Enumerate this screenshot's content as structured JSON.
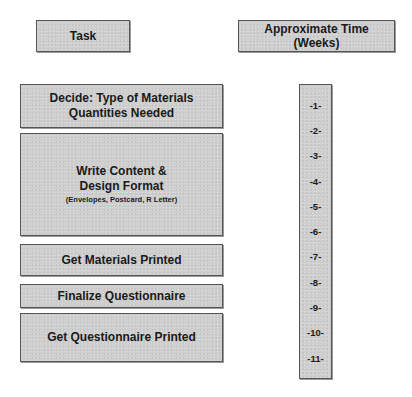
{
  "headers": {
    "task": "Task",
    "time_line1": "Approximate Time",
    "time_line2": "(Weeks)"
  },
  "tasks": [
    {
      "line1": "Decide: Type of Materials",
      "line2": "Quantities Needed",
      "sub": ""
    },
    {
      "line1": "Write Content &",
      "line2": "Design Format",
      "sub": "(Envelopes, Postcard, R Letter)"
    },
    {
      "line1": "Get Materials Printed",
      "line2": "",
      "sub": ""
    },
    {
      "line1": "Finalize Questionnaire",
      "line2": "",
      "sub": ""
    },
    {
      "line1": "Get Questionnaire Printed",
      "line2": "",
      "sub": ""
    }
  ],
  "weeks": [
    "-1-",
    "-2-",
    "-3-",
    "-4-",
    "-5-",
    "-6-",
    "-7-",
    "-8-",
    "-9-",
    "-10-",
    "-11-"
  ],
  "colors": {
    "box_fill": "#cfcfcf",
    "box_border": "#555555",
    "text": "#1a1a1a"
  }
}
